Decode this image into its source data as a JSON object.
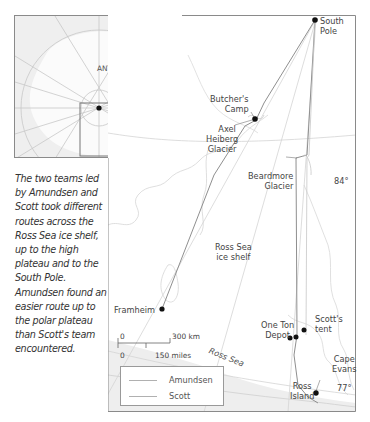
{
  "inset": {
    "label": "ANTARCTICA"
  },
  "caption": "The two teams led by Amundsen and Scott took different routes across the Ross Sea ice shelf, up to the high plateau and to the South Pole. Amundsen found an easier route up to the polar plateau than Scott's team encountered.",
  "places": {
    "south_pole": [
      "South",
      "Pole"
    ],
    "butchers_camp": [
      "Butcher's",
      "Camp"
    ],
    "axel_heiberg": [
      "Axel",
      "Heiberg",
      "Glacier"
    ],
    "beardmore": [
      "Beardmore",
      "Glacier"
    ],
    "ross_ice_shelf": [
      "Ross Sea",
      "ice shelf"
    ],
    "framheim": "Framheim",
    "scotts_tent": [
      "Scott's",
      "tent"
    ],
    "one_ton_depot": [
      "One Ton",
      "Depot"
    ],
    "cape_evans": [
      "Cape",
      "Evans"
    ],
    "ross_island": [
      "Ross",
      "Island"
    ],
    "ross_sea": "Ross Sea"
  },
  "latitudes": {
    "lat84": "84°",
    "lat77": "77°"
  },
  "scale": {
    "km_zero": "0",
    "km_label": "300 km",
    "mi_zero": "0",
    "mi_label": "150 miles"
  },
  "legend": {
    "items": [
      {
        "label": "Amundsen",
        "color": "#a8a8a8"
      },
      {
        "label": "Scott",
        "color": "#a8a8a8"
      }
    ]
  },
  "colors": {
    "frame": "#8a8a8a",
    "route": "#9a9a9a",
    "land": "#f4f4f4",
    "coast": "#d8d8d8",
    "dot": "#111111"
  }
}
